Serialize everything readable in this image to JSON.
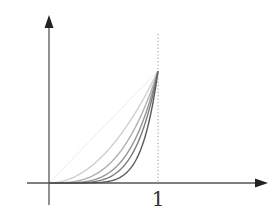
{
  "chart_data": {
    "type": "line",
    "title": "",
    "xlabel": "",
    "ylabel": "",
    "x_ticks": [
      "1"
    ],
    "xlim": [
      -0.2,
      2.0
    ],
    "ylim": [
      -0.2,
      1.5
    ],
    "grid": false,
    "legend": null,
    "annotations": [
      "dotted vertical line at x = 1"
    ],
    "series": [
      {
        "name": "x^1",
        "exponent": 1,
        "color": "#ebebeb",
        "x": [
          0,
          0.2,
          0.4,
          0.6,
          0.8,
          1.0
        ],
        "values": [
          0,
          0.2,
          0.4,
          0.6,
          0.8,
          1.0
        ]
      },
      {
        "name": "x^2",
        "exponent": 2,
        "color": "#cfcfcf",
        "x": [
          0,
          0.2,
          0.4,
          0.6,
          0.8,
          1.0
        ],
        "values": [
          0,
          0.04,
          0.16,
          0.36,
          0.64,
          1.0
        ]
      },
      {
        "name": "x^3",
        "exponent": 3,
        "color": "#b0b0b0",
        "x": [
          0,
          0.2,
          0.4,
          0.6,
          0.8,
          1.0
        ],
        "values": [
          0,
          0.008,
          0.064,
          0.216,
          0.512,
          1.0
        ]
      },
      {
        "name": "x^4",
        "exponent": 4,
        "color": "#959595",
        "x": [
          0,
          0.2,
          0.4,
          0.6,
          0.8,
          1.0
        ],
        "values": [
          0,
          0.0016,
          0.0256,
          0.1296,
          0.4096,
          1.0
        ]
      },
      {
        "name": "x^5",
        "exponent": 5,
        "color": "#7a7a7a",
        "x": [
          0,
          0.2,
          0.4,
          0.6,
          0.8,
          1.0
        ],
        "values": [
          0,
          0.0003,
          0.0102,
          0.0778,
          0.3277,
          1.0
        ]
      },
      {
        "name": "x^7",
        "exponent": 7,
        "color": "#5a5a5a",
        "x": [
          0,
          0.2,
          0.4,
          0.6,
          0.8,
          1.0
        ],
        "values": [
          0,
          0.0,
          0.0016,
          0.028,
          0.2097,
          1.0
        ]
      }
    ]
  },
  "axes": {
    "x_tick_label": "1",
    "axis_color": "#555555",
    "dotted_line_color": "#999999"
  }
}
